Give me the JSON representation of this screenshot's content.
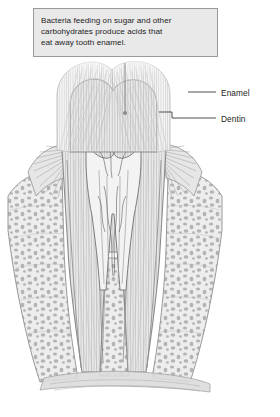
{
  "figure": {
    "type": "anatomical-cross-section",
    "palette": {
      "background": "#ffffff",
      "callout_fill": "#e9e9e9",
      "callout_border": "#9a9a9a",
      "text": "#1d1d1d",
      "leader_line": "#6e6e6e",
      "enamel_light": "#f2f2f2",
      "enamel_stroke": "#c9c9c9",
      "dentin_fill": "#e4e4e4",
      "dentin_stroke": "#8f8f8f",
      "pulp_stroke": "#7a7a7a",
      "bone_fill": "#d2d2d2",
      "bone_stroke": "#8a8a8a",
      "gum_fill": "#e0e0e0"
    }
  },
  "callout": {
    "text": "Bacteria feeding on sugar and other\ncarbohydrates produce acids that\neat away tooth enamel."
  },
  "labels": [
    {
      "id": "enamel",
      "text": "Enamel"
    },
    {
      "id": "dentin",
      "text": "Dentin"
    }
  ],
  "bottom_strip": {
    "text": "",
    "note": "cropped illegible text row at image edge"
  }
}
